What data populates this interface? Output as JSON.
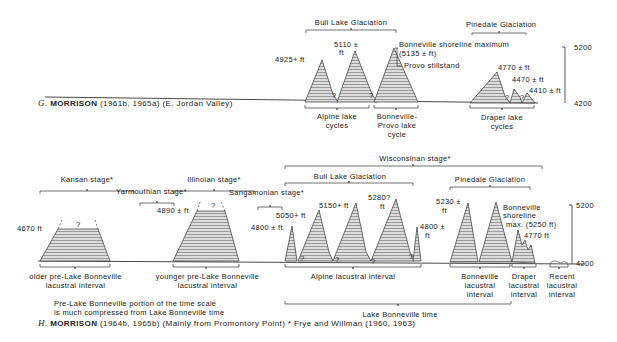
{
  "panel_g": {
    "caption_letter": "G.",
    "caption_author": "MORRISON",
    "caption_rest": "(1961b, 1965a) (E. Jordan Valley)",
    "glaciations": [
      {
        "label": "Bull Lake Glaciation"
      },
      {
        "label": "Pinedale Glaciation"
      }
    ],
    "peaks": {
      "p1": "4925+ ft",
      "p2a": "5110 ±",
      "p2b": "ft",
      "p3a": "Bonneville shoreline maximum",
      "p3b": "(5135 ± ft)",
      "p3c": "Provo stillstand",
      "p4": "4770 ± ft",
      "p5": "4470 ± ft",
      "p6": "4410 ± ft"
    },
    "intervals": [
      {
        "label_1": "Alpine lake",
        "label_2": "cycles"
      },
      {
        "label_1": "Bonneville-",
        "label_2": "Provo lake",
        "label_3": "cycle"
      },
      {
        "label_1": "Draper lake",
        "label_2": "cycles"
      }
    ],
    "scale": {
      "top": "5200",
      "bottom": "4200"
    },
    "unknown_mark": "?"
  },
  "panel_h": {
    "caption_letter": "H.",
    "caption_author": "MORRISON",
    "caption_rest": "(1964b, 1965b) (Mainly from Promontory Point) * Frye and Willman (1960, 1963)",
    "stages": {
      "kansan": "Kansan stage*",
      "yarmouthian": "Yarmouthian stage*",
      "illinoian": "Illinoian stage*",
      "sangamonian": "Sangamonian stage*",
      "wisconsinan": "Wisconsinan stage*",
      "bull_lake": "Bull Lake Glaciation",
      "pinedale": "Pinedale Glaciation"
    },
    "peaks": {
      "k": "4670 ft",
      "i": "4890 ± ft",
      "s": "4800 ± ft",
      "b1": "5050+ ft",
      "b2": "5150+ ft",
      "b3a": "5280?",
      "b3b": "ft",
      "b4a": "4800 ±",
      "b4b": "ft",
      "p1a": "5230 ±",
      "p1b": "ft",
      "p2a": "Bonneville",
      "p2b": "shoreline",
      "p2c": "max. (5250 ft)",
      "p3": "4770 ft"
    },
    "intervals": {
      "older_1": "older pre-Lake Bonneville",
      "older_2": "lacustral interval",
      "younger_1": "younger pre-Lake Bonneville",
      "younger_2": "lacustral interval",
      "alpine": "Alpine lacustral interval",
      "bonneville_1": "Bonneville",
      "bonneville_2": "lacustral",
      "bonneville_3": "interval",
      "draper_1": "Draper",
      "draper_2": "lacustral",
      "draper_3": "interval",
      "recent_1": "Recent",
      "recent_2": "lacustral",
      "recent_3": "interval",
      "lake_bonneville_time": "Lake Bonneville time"
    },
    "note_1": "Pre-Lake Bonneville portion of the time scale",
    "note_2": "is much compressed from Lake Bonneville time",
    "scale": {
      "top": "5200",
      "bottom": "4200"
    },
    "unknown_mark": "?"
  }
}
